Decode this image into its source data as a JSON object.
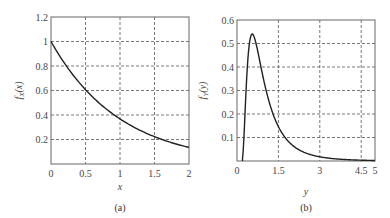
{
  "chart_data": [
    {
      "type": "line",
      "caption": "(a)",
      "xlabel": "x",
      "ylabel": "f_X(x)",
      "ylabel_main": "f",
      "ylabel_sub": "X",
      "ylabel_arg": "(x)",
      "xlim": [
        0,
        2
      ],
      "ylim": [
        0,
        1.2
      ],
      "grid": true,
      "xticks": [
        0,
        0.5,
        1,
        1.5,
        2
      ],
      "xtick_labels": [
        "0",
        "0.5",
        "1",
        "1.5",
        "2"
      ],
      "yticks": [
        0.2,
        0.4,
        0.6,
        0.8,
        1,
        1.2
      ],
      "ytick_labels": [
        "0.2",
        "0.4",
        "0.6",
        "0.8",
        "1",
        "1.2"
      ],
      "series": [
        {
          "name": "f_X(x)",
          "x": [
            0,
            0.25,
            0.5,
            0.75,
            1,
            1.25,
            1.5,
            1.75,
            2
          ],
          "y": [
            1.0,
            0.78,
            0.61,
            0.47,
            0.37,
            0.29,
            0.22,
            0.17,
            0.14
          ]
        }
      ]
    },
    {
      "type": "line",
      "caption": "(b)",
      "xlabel": "y",
      "ylabel": "f_Y(y)",
      "ylabel_main": "f",
      "ylabel_sub": "Y",
      "ylabel_arg": "(y)",
      "xlim": [
        0,
        5
      ],
      "ylim": [
        0,
        0.6
      ],
      "grid": true,
      "xticks": [
        0,
        1.5,
        3,
        4.5,
        5
      ],
      "xtick_labels": [
        "0",
        "1.5",
        "3",
        "4.5",
        "5"
      ],
      "yticks": [
        0.1,
        0.2,
        0.3,
        0.4,
        0.5,
        0.6
      ],
      "ytick_labels": [
        "0.1",
        "0.2",
        "0.3",
        "0.4",
        "0.5",
        "0.6"
      ],
      "series": [
        {
          "name": "f_Y(y)",
          "x": [
            0.2,
            0.3,
            0.4,
            0.5,
            0.6,
            0.7,
            0.8,
            1.0,
            1.2,
            1.5,
            2.0,
            2.5,
            3.0,
            3.5,
            4.0,
            4.5,
            5.0
          ],
          "y": [
            0.0,
            0.3,
            0.49,
            0.54,
            0.53,
            0.49,
            0.44,
            0.36,
            0.29,
            0.21,
            0.14,
            0.105,
            0.08,
            0.062,
            0.05,
            0.04,
            0.033
          ]
        }
      ]
    }
  ]
}
